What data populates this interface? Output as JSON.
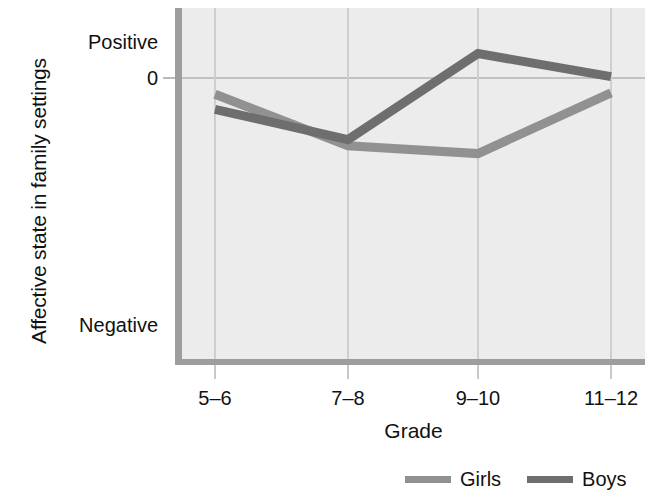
{
  "chart_data": {
    "type": "line",
    "title": "",
    "xlabel": "Grade",
    "ylabel": "Affective state in family settings",
    "categories": [
      "5–6",
      "7–8",
      "9–10",
      "11–12"
    ],
    "grid": true,
    "legend_position": "bottom-right",
    "y_tick_labels": [
      "Positive",
      "0",
      "Negative"
    ],
    "y_tick_values": [
      1.0,
      0.0,
      -3.1
    ],
    "ylim": [
      -3.6,
      1.2
    ],
    "series": [
      {
        "name": "Girls",
        "color": "#919191",
        "values": [
          -0.45,
          -1.88,
          -2.1,
          -0.41
        ]
      },
      {
        "name": "Boys",
        "color": "#6e6e6e",
        "values": [
          -0.87,
          -1.71,
          0.68,
          0.04
        ]
      }
    ]
  },
  "axes": {
    "y_title": "Affective state in family settings",
    "x_title": "Grade",
    "y_labels": {
      "positive": "Positive",
      "zero": "0",
      "negative": "Negative"
    },
    "x_labels": [
      "5–6",
      "7–8",
      "9–10",
      "11–12"
    ]
  },
  "legend": {
    "items": [
      {
        "label": "Girls",
        "color": "#919191"
      },
      {
        "label": "Boys",
        "color": "#6e6e6e"
      }
    ]
  },
  "style": {
    "plot_background": "#ececec",
    "page_background": "#ffffff",
    "axis_color": "#9d9d9d",
    "gridline_color": "#cfcfcf",
    "text_color": "#111111"
  }
}
